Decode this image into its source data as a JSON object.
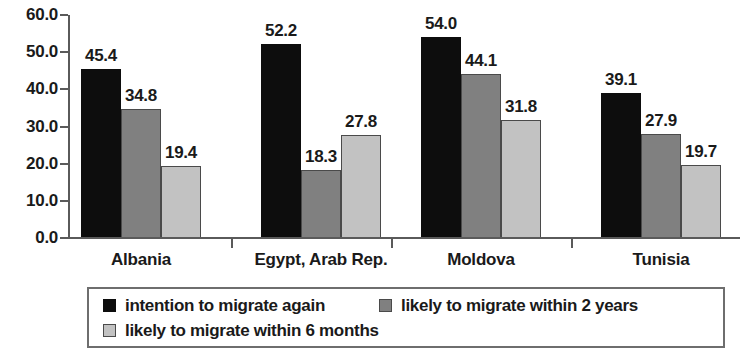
{
  "chart_data": {
    "type": "bar",
    "title": "",
    "subtitle": "",
    "xlabel": "",
    "ylabel": "",
    "categories": [
      "Albania",
      "Egypt, Arab Rep.",
      "Moldova",
      "Tunisia"
    ],
    "series": [
      {
        "name": "intention to migrate again",
        "color": "#0d0d0d",
        "values": [
          45.4,
          52.2,
          54.0,
          39.1
        ],
        "labels": [
          "45.4",
          "52.2",
          "54.0",
          "39.1"
        ]
      },
      {
        "name": "likely to migrate within 2 years",
        "color": "#808080",
        "values": [
          34.8,
          18.3,
          44.1,
          27.9
        ],
        "labels": [
          "34.8",
          "18.3",
          "44.1",
          "27.9"
        ]
      },
      {
        "name": "likely to migrate within 6 months",
        "color": "#c2c2c2",
        "values": [
          19.4,
          27.8,
          31.8,
          19.7
        ],
        "labels": [
          "19.4",
          "27.8",
          "31.8",
          "19.7"
        ]
      }
    ],
    "ylim": [
      0,
      60
    ],
    "ytick_values": [
      0,
      10,
      20,
      30,
      40,
      50,
      60
    ],
    "ytick_labels": [
      "0.0",
      "10.0",
      "20.0",
      "30.0",
      "40.0",
      "50.0",
      "60.0"
    ],
    "grid": false,
    "legend_position": "bottom",
    "legend_border": true,
    "data_labels_shown": true
  }
}
